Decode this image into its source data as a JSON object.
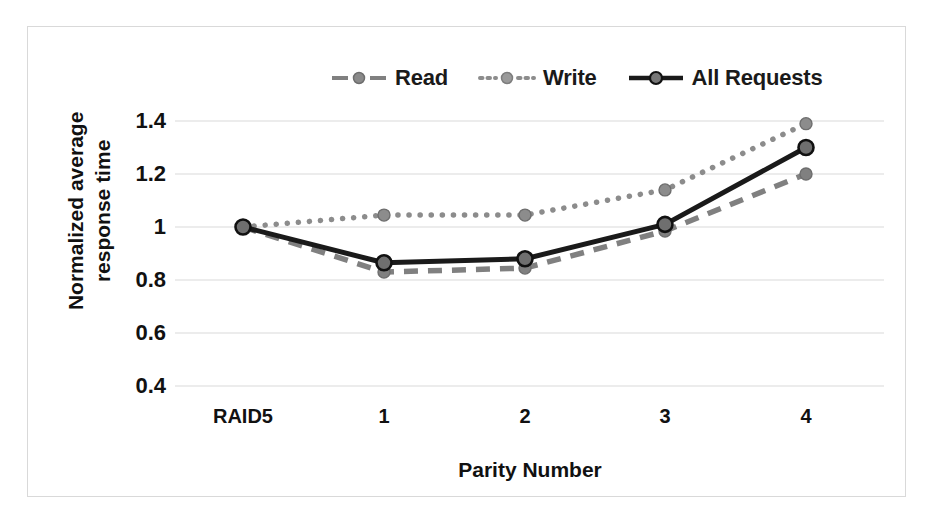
{
  "chart_data": {
    "type": "line",
    "title": "",
    "xlabel": "Parity Number",
    "ylabel": "Normalized average response time",
    "categories": [
      "RAID5",
      "1",
      "2",
      "3",
      "4"
    ],
    "ylim": [
      0.4,
      1.4
    ],
    "yticks": [
      "0.4",
      "0.6",
      "0.8",
      "1",
      "1.2",
      "1.4"
    ],
    "ytick_values": [
      0.4,
      0.6,
      0.8,
      1.0,
      1.2,
      1.4
    ],
    "grid": true,
    "legend_position": "top-center",
    "series": [
      {
        "name": "Read",
        "values": [
          1.0,
          0.83,
          0.845,
          0.985,
          1.2
        ],
        "color": "#808080",
        "line_style": "dashed",
        "marker": "circle"
      },
      {
        "name": "Write",
        "values": [
          1.0,
          1.045,
          1.045,
          1.14,
          1.39
        ],
        "color": "#8c8c8c",
        "line_style": "dotted",
        "marker": "circle"
      },
      {
        "name": "All Requests",
        "values": [
          1.0,
          0.865,
          0.88,
          1.01,
          1.3
        ],
        "color": "#1a1a1a",
        "line_style": "solid",
        "marker": "circle"
      }
    ]
  },
  "axis": {
    "y_title_line1": "Normalized average",
    "y_title_line2": "response time",
    "x_title": "Parity Number"
  },
  "legend": {
    "items": [
      {
        "label": "Read"
      },
      {
        "label": "Write"
      },
      {
        "label": "All Requests"
      }
    ]
  },
  "colors": {
    "read": "#808080",
    "write": "#8c8c8c",
    "all_requests": "#1a1a1a",
    "grid": "#d9d9d9",
    "border": "#d9d9d9",
    "text": "#111111"
  }
}
